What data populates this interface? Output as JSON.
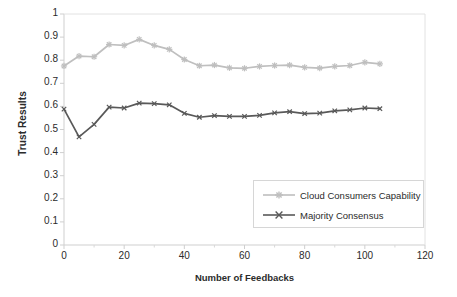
{
  "chart_data": {
    "type": "line",
    "title": "",
    "xlabel": "Number of Feedbacks",
    "ylabel": "Trust Results",
    "xlim": [
      0,
      120
    ],
    "ylim": [
      0,
      1
    ],
    "xticks": [
      "0",
      "20",
      "40",
      "60",
      "80",
      "100",
      "120"
    ],
    "xtick_values": [
      0,
      20,
      40,
      60,
      80,
      100,
      120
    ],
    "yticks": [
      "0",
      "0.1",
      "0.2",
      "0.3",
      "0.4",
      "0.5",
      "0.6",
      "0.7",
      "0.8",
      "0.9",
      "1"
    ],
    "ytick_values": [
      0,
      0.1,
      0.2,
      0.3,
      0.4,
      0.5,
      0.6,
      0.7,
      0.8,
      0.9,
      1
    ],
    "grid": false,
    "legend_position": "inside-lower-right",
    "x": [
      0,
      5,
      10,
      15,
      20,
      25,
      30,
      35,
      40,
      45,
      50,
      55,
      60,
      65,
      70,
      75,
      80,
      85,
      90,
      95,
      100,
      105
    ],
    "series": [
      {
        "name": "Cloud Consumers Capability",
        "color": "#bfbfbf",
        "marker": "star",
        "values": [
          0.775,
          0.818,
          0.815,
          0.868,
          0.864,
          0.89,
          0.864,
          0.847,
          0.803,
          0.776,
          0.779,
          0.767,
          0.765,
          0.773,
          0.777,
          0.779,
          0.769,
          0.766,
          0.773,
          0.777,
          0.791,
          0.784
        ]
      },
      {
        "name": "Majority Consensus",
        "color": "#595959",
        "marker": "x",
        "values": [
          0.588,
          0.468,
          0.522,
          0.597,
          0.593,
          0.614,
          0.612,
          0.607,
          0.57,
          0.553,
          0.56,
          0.557,
          0.557,
          0.561,
          0.572,
          0.577,
          0.569,
          0.571,
          0.581,
          0.585,
          0.593,
          0.59
        ]
      }
    ]
  },
  "axes": {
    "y_title": "Trust Results",
    "x_title": "Number of Feedbacks"
  },
  "colors": {
    "series_light": "#bfbfbf",
    "series_dark": "#595959",
    "axis": "#d0d0d0",
    "text": "#2b2b2b",
    "legend_border": "#d6d6d6",
    "background": "#ffffff"
  },
  "legend": {
    "items": [
      {
        "label": "Cloud Consumers Capability"
      },
      {
        "label": "Majority Consensus"
      }
    ]
  }
}
